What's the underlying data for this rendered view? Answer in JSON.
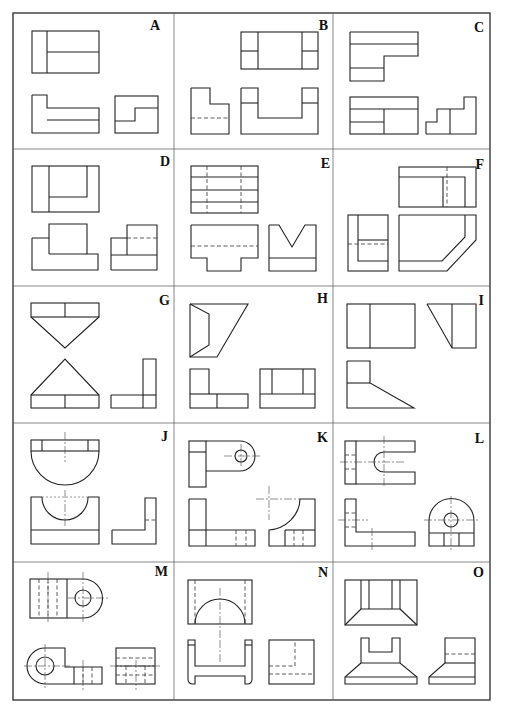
{
  "figure": {
    "grid": {
      "columns": 3,
      "rows": 5
    }
  },
  "cells": [
    {
      "label": "A",
      "views": 3
    },
    {
      "label": "B",
      "views": 3
    },
    {
      "label": "C",
      "views": 3
    },
    {
      "label": "D",
      "views": 3
    },
    {
      "label": "E",
      "views": 3
    },
    {
      "label": "F",
      "views": 3
    },
    {
      "label": "G",
      "views": 3
    },
    {
      "label": "H",
      "views": 3
    },
    {
      "label": "I",
      "views": 3
    },
    {
      "label": "J",
      "views": 3
    },
    {
      "label": "K",
      "views": 3
    },
    {
      "label": "L",
      "views": 3
    },
    {
      "label": "M",
      "views": 3
    },
    {
      "label": "N",
      "views": 3
    },
    {
      "label": "O",
      "views": 3
    }
  ],
  "colors": {
    "line": "#222222",
    "background": "#ffffff"
  }
}
